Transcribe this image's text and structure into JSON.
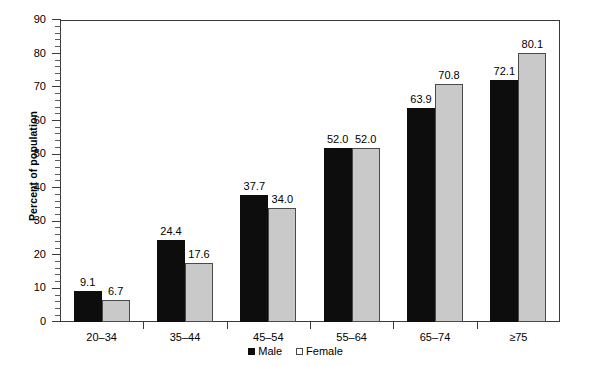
{
  "chart_data": {
    "type": "bar",
    "title": "",
    "xlabel": "",
    "ylabel": "Percent of population",
    "ylim": [
      0,
      90
    ],
    "ytick_step": 10,
    "yminor_step": 2,
    "grid": false,
    "legend_position": "bottom-center",
    "categories": [
      "20–34",
      "35–44",
      "45–54",
      "55–64",
      "65–74",
      "≥75"
    ],
    "ytick_labels": [
      "0",
      "10",
      "20",
      "30",
      "40",
      "50",
      "60",
      "70",
      "80",
      "90"
    ],
    "series": [
      {
        "name": "Male",
        "color": "#0d0d0d",
        "values": [
          9.1,
          24.4,
          37.7,
          52.0,
          63.9,
          72.1
        ],
        "labels": [
          "9.1",
          "24.4",
          "37.7",
          "52.0",
          "63.9",
          "72.1"
        ]
      },
      {
        "name": "Female",
        "color": "#c9c9c9",
        "values": [
          6.7,
          17.6,
          34.0,
          52.0,
          70.8,
          80.1
        ],
        "labels": [
          "6.7",
          "17.6",
          "34.0",
          "52.0",
          "70.8",
          "80.1"
        ]
      }
    ]
  },
  "legend": {
    "items": [
      {
        "label": "Male",
        "swatch": "filled-square-black"
      },
      {
        "label": "Female",
        "swatch": "open-square-gray"
      }
    ]
  },
  "colors": {
    "male_bar": "#0d0d0d",
    "female_bar": "#c9c9c9",
    "female_border": "#4a4a4a",
    "axis": "#3a3a3a",
    "background": "#ffffff",
    "text": "#000000"
  }
}
